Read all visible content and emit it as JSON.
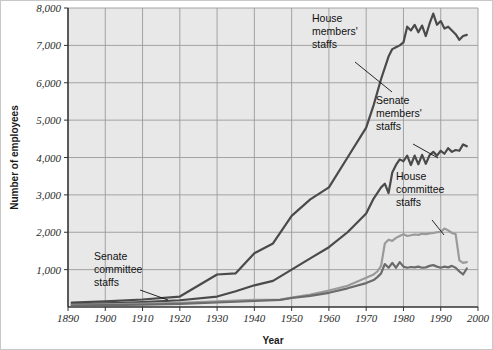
{
  "chart_data": {
    "type": "line",
    "title": "",
    "xlabel": "Year",
    "ylabel": "Number of employees",
    "xlim": [
      1890,
      2000
    ],
    "ylim": [
      0,
      8000
    ],
    "xticks": [
      "1890",
      "1900",
      "1910",
      "1920",
      "1930",
      "1940",
      "1950",
      "1960",
      "1970",
      "1980",
      "1990",
      "2000"
    ],
    "yticks": [
      "1,000",
      "2,000",
      "3,000",
      "4,000",
      "5,000",
      "6,000",
      "7,000",
      "8,000"
    ],
    "grid": true,
    "legend_position": "inline-annotations",
    "series": [
      {
        "name": "House members' staffs",
        "color": "#4a4a4a",
        "points": [
          [
            1891,
            120
          ],
          [
            1900,
            150
          ],
          [
            1910,
            200
          ],
          [
            1920,
            280
          ],
          [
            1930,
            870
          ],
          [
            1935,
            900
          ],
          [
            1940,
            1440
          ],
          [
            1945,
            1700
          ],
          [
            1950,
            2440
          ],
          [
            1955,
            2880
          ],
          [
            1960,
            3200
          ],
          [
            1965,
            4000
          ],
          [
            1970,
            4800
          ],
          [
            1972,
            5400
          ],
          [
            1974,
            6100
          ],
          [
            1976,
            6700
          ],
          [
            1977,
            6900
          ],
          [
            1978,
            6950
          ],
          [
            1979,
            7000
          ],
          [
            1980,
            7080
          ],
          [
            1981,
            7500
          ],
          [
            1982,
            7400
          ],
          [
            1983,
            7550
          ],
          [
            1984,
            7350
          ],
          [
            1985,
            7530
          ],
          [
            1986,
            7250
          ],
          [
            1987,
            7580
          ],
          [
            1988,
            7850
          ],
          [
            1989,
            7550
          ],
          [
            1990,
            7650
          ],
          [
            1991,
            7450
          ],
          [
            1992,
            7500
          ],
          [
            1993,
            7400
          ],
          [
            1994,
            7300
          ],
          [
            1995,
            7150
          ],
          [
            1996,
            7250
          ],
          [
            1997,
            7280
          ]
        ]
      },
      {
        "name": "Senate members' staffs",
        "color": "#4a4a4a",
        "points": [
          [
            1891,
            80
          ],
          [
            1900,
            100
          ],
          [
            1910,
            130
          ],
          [
            1920,
            180
          ],
          [
            1930,
            280
          ],
          [
            1935,
            420
          ],
          [
            1940,
            580
          ],
          [
            1945,
            700
          ],
          [
            1950,
            1000
          ],
          [
            1955,
            1300
          ],
          [
            1960,
            1600
          ],
          [
            1965,
            2000
          ],
          [
            1970,
            2500
          ],
          [
            1972,
            2900
          ],
          [
            1974,
            3200
          ],
          [
            1975,
            3300
          ],
          [
            1976,
            3050
          ],
          [
            1977,
            3600
          ],
          [
            1978,
            3800
          ],
          [
            1979,
            3950
          ],
          [
            1980,
            3900
          ],
          [
            1981,
            4050
          ],
          [
            1982,
            3800
          ],
          [
            1983,
            4050
          ],
          [
            1984,
            3820
          ],
          [
            1985,
            4070
          ],
          [
            1986,
            3830
          ],
          [
            1987,
            4060
          ],
          [
            1988,
            4150
          ],
          [
            1989,
            4050
          ],
          [
            1990,
            4180
          ],
          [
            1991,
            4100
          ],
          [
            1992,
            4250
          ],
          [
            1993,
            4150
          ],
          [
            1994,
            4200
          ],
          [
            1995,
            4180
          ],
          [
            1996,
            4350
          ],
          [
            1997,
            4300
          ]
        ]
      },
      {
        "name": "House committee staffs",
        "color": "#9a9a9a",
        "points": [
          [
            1891,
            60
          ],
          [
            1900,
            70
          ],
          [
            1910,
            90
          ],
          [
            1920,
            110
          ],
          [
            1930,
            150
          ],
          [
            1940,
            190
          ],
          [
            1947,
            200
          ],
          [
            1950,
            250
          ],
          [
            1955,
            330
          ],
          [
            1960,
            440
          ],
          [
            1965,
            570
          ],
          [
            1970,
            780
          ],
          [
            1972,
            870
          ],
          [
            1973,
            950
          ],
          [
            1974,
            1100
          ],
          [
            1975,
            1700
          ],
          [
            1976,
            1800
          ],
          [
            1977,
            1770
          ],
          [
            1978,
            1850
          ],
          [
            1979,
            1900
          ],
          [
            1980,
            1950
          ],
          [
            1981,
            1900
          ],
          [
            1982,
            1920
          ],
          [
            1983,
            1940
          ],
          [
            1984,
            1930
          ],
          [
            1985,
            1960
          ],
          [
            1986,
            1950
          ],
          [
            1987,
            1970
          ],
          [
            1988,
            1980
          ],
          [
            1989,
            2000
          ],
          [
            1990,
            2010
          ],
          [
            1991,
            2100
          ],
          [
            1992,
            2050
          ],
          [
            1993,
            1980
          ],
          [
            1994,
            1950
          ],
          [
            1995,
            1250
          ],
          [
            1996,
            1180
          ],
          [
            1997,
            1200
          ]
        ]
      },
      {
        "name": "Senate committee staffs",
        "color": "#6b6b6b",
        "points": [
          [
            1891,
            40
          ],
          [
            1900,
            50
          ],
          [
            1910,
            65
          ],
          [
            1920,
            85
          ],
          [
            1930,
            120
          ],
          [
            1940,
            160
          ],
          [
            1947,
            190
          ],
          [
            1950,
            240
          ],
          [
            1955,
            300
          ],
          [
            1960,
            380
          ],
          [
            1965,
            500
          ],
          [
            1970,
            640
          ],
          [
            1972,
            720
          ],
          [
            1973,
            800
          ],
          [
            1974,
            900
          ],
          [
            1975,
            1150
          ],
          [
            1976,
            1050
          ],
          [
            1977,
            1180
          ],
          [
            1978,
            1050
          ],
          [
            1979,
            1200
          ],
          [
            1980,
            1080
          ],
          [
            1981,
            1050
          ],
          [
            1982,
            1070
          ],
          [
            1983,
            1060
          ],
          [
            1984,
            1080
          ],
          [
            1985,
            1050
          ],
          [
            1986,
            1060
          ],
          [
            1987,
            1100
          ],
          [
            1988,
            1120
          ],
          [
            1989,
            1080
          ],
          [
            1990,
            1050
          ],
          [
            1991,
            1080
          ],
          [
            1992,
            1060
          ],
          [
            1993,
            1100
          ],
          [
            1994,
            1050
          ],
          [
            1995,
            950
          ],
          [
            1996,
            870
          ],
          [
            1997,
            1030
          ]
        ]
      }
    ],
    "annotations": [
      {
        "id": "house-members",
        "lines": [
          "House",
          "members'",
          "staffs"
        ],
        "text_x": 312,
        "text_y": 22,
        "leader": [
          [
            355,
            62
          ],
          [
            392,
            92
          ]
        ]
      },
      {
        "id": "senate-members",
        "lines": [
          "Senate",
          "members'",
          "staffs"
        ],
        "text_x": 376,
        "text_y": 104,
        "leader": [
          [
            413,
            144
          ],
          [
            438,
            158
          ]
        ]
      },
      {
        "id": "house-committee",
        "lines": [
          "House",
          "committee",
          "staffs"
        ],
        "text_x": 396,
        "text_y": 180,
        "leader": [
          [
            432,
            220
          ],
          [
            444,
            235
          ]
        ]
      },
      {
        "id": "senate-committee",
        "lines": [
          "Senate",
          "committee",
          "staffs"
        ],
        "text_x": 94,
        "text_y": 260,
        "leader": [
          [
            140,
            290
          ],
          [
            168,
            300
          ]
        ]
      }
    ]
  },
  "colors": {
    "plot_background": "#e8e8e8",
    "grid": "#9b9b9b",
    "axis": "#333333",
    "page_background": "#ffffff",
    "border": "#c8c8c8"
  }
}
